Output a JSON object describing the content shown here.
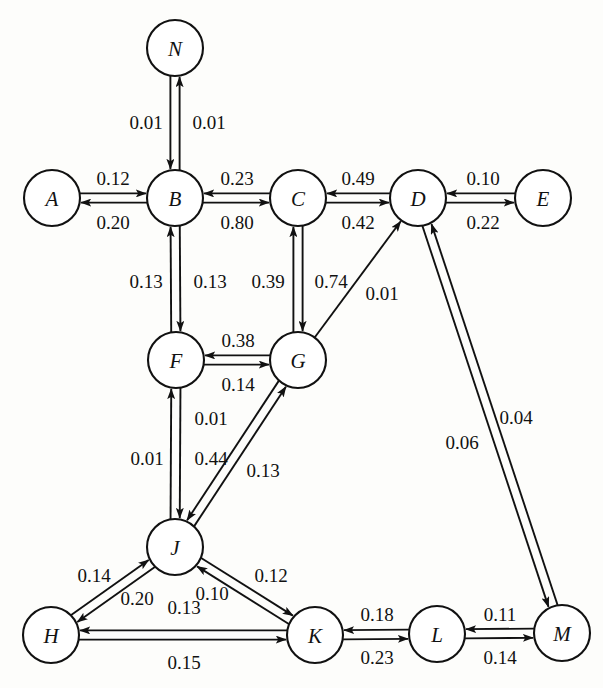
{
  "diagram": {
    "type": "directed-weighted-graph",
    "background_color": "#fdfdfb",
    "stroke_color": "#111111",
    "node_fill": "#ffffff",
    "node_radius": 28,
    "nodes": [
      {
        "id": "N",
        "label": "N",
        "x": 175,
        "y": 48
      },
      {
        "id": "A",
        "label": "A",
        "x": 52,
        "y": 198
      },
      {
        "id": "B",
        "label": "B",
        "x": 175,
        "y": 198
      },
      {
        "id": "C",
        "label": "C",
        "x": 298,
        "y": 198
      },
      {
        "id": "D",
        "label": "D",
        "x": 418,
        "y": 198
      },
      {
        "id": "E",
        "label": "E",
        "x": 543,
        "y": 198
      },
      {
        "id": "F",
        "label": "F",
        "x": 176,
        "y": 360
      },
      {
        "id": "G",
        "label": "G",
        "x": 298,
        "y": 360
      },
      {
        "id": "J",
        "label": "J",
        "x": 175,
        "y": 547
      },
      {
        "id": "H",
        "label": "H",
        "x": 51,
        "y": 635
      },
      {
        "id": "K",
        "label": "K",
        "x": 315,
        "y": 635
      },
      {
        "id": "L",
        "label": "L",
        "x": 437,
        "y": 634
      },
      {
        "id": "M",
        "label": "M",
        "x": 562,
        "y": 633
      }
    ],
    "edges": [
      {
        "from": "N",
        "to": "B",
        "weight": "0.01",
        "label_x": 146,
        "label_y": 122
      },
      {
        "from": "B",
        "to": "N",
        "weight": "0.01",
        "label_x": 209,
        "label_y": 122
      },
      {
        "from": "A",
        "to": "B",
        "weight": "0.12",
        "label_x": 113,
        "label_y": 178
      },
      {
        "from": "B",
        "to": "A",
        "weight": "0.20",
        "label_x": 113,
        "label_y": 222
      },
      {
        "from": "C",
        "to": "B",
        "weight": "0.23",
        "label_x": 237,
        "label_y": 178
      },
      {
        "from": "B",
        "to": "C",
        "weight": "0.80",
        "label_x": 237,
        "label_y": 222
      },
      {
        "from": "D",
        "to": "C",
        "weight": "0.49",
        "label_x": 358,
        "label_y": 178
      },
      {
        "from": "C",
        "to": "D",
        "weight": "0.42",
        "label_x": 358,
        "label_y": 222
      },
      {
        "from": "E",
        "to": "D",
        "weight": "0.10",
        "label_x": 483,
        "label_y": 178
      },
      {
        "from": "D",
        "to": "E",
        "weight": "0.22",
        "label_x": 483,
        "label_y": 222
      },
      {
        "from": "B",
        "to": "F",
        "weight": "0.13",
        "label_x": 146,
        "label_y": 281
      },
      {
        "from": "F",
        "to": "B",
        "weight": "0.13",
        "label_x": 210,
        "label_y": 281
      },
      {
        "from": "C",
        "to": "G",
        "weight": "0.39",
        "label_x": 268,
        "label_y": 281
      },
      {
        "from": "G",
        "to": "C",
        "weight": "0.74",
        "label_x": 331,
        "label_y": 281
      },
      {
        "from": "G",
        "to": "F",
        "weight": "0.38",
        "label_x": 238,
        "label_y": 340
      },
      {
        "from": "F",
        "to": "G",
        "weight": "0.14",
        "label_x": 238,
        "label_y": 384
      },
      {
        "from": "G",
        "to": "D",
        "weight": "0.01",
        "label_x": 382,
        "label_y": 293
      },
      {
        "from": "M",
        "to": "D",
        "weight": "0.06",
        "label_x": 462,
        "label_y": 442
      },
      {
        "from": "D",
        "to": "M",
        "weight": "0.04",
        "label_x": 516,
        "label_y": 417
      },
      {
        "from": "F",
        "to": "J",
        "weight": "0.01",
        "label_x": 147,
        "label_y": 458
      },
      {
        "from": "J",
        "to": "F",
        "weight": "0.01",
        "label_x": 211,
        "label_y": 418
      },
      {
        "from": "J",
        "to": "G",
        "weight": "0.44",
        "label_x": 211,
        "label_y": 458
      },
      {
        "from": "G",
        "to": "J",
        "weight": "0.13",
        "label_x": 263,
        "label_y": 470
      },
      {
        "from": "H",
        "to": "J",
        "weight": "0.14",
        "label_x": 94,
        "label_y": 575
      },
      {
        "from": "J",
        "to": "H",
        "weight": "0.20",
        "label_x": 137,
        "label_y": 598
      },
      {
        "from": "J",
        "to": "K",
        "weight": "0.10",
        "label_x": 212,
        "label_y": 593
      },
      {
        "from": "K",
        "to": "J",
        "weight": "0.12",
        "label_x": 271,
        "label_y": 575
      },
      {
        "from": "K",
        "to": "H",
        "weight": "0.13",
        "label_x": 184,
        "label_y": 607
      },
      {
        "from": "H",
        "to": "K",
        "weight": "0.15",
        "label_x": 184,
        "label_y": 662
      },
      {
        "from": "L",
        "to": "K",
        "weight": "0.18",
        "label_x": 377,
        "label_y": 614
      },
      {
        "from": "K",
        "to": "L",
        "weight": "0.23",
        "label_x": 377,
        "label_y": 657
      },
      {
        "from": "M",
        "to": "L",
        "weight": "0.11",
        "label_x": 500,
        "label_y": 614
      },
      {
        "from": "L",
        "to": "M",
        "weight": "0.14",
        "label_x": 500,
        "label_y": 657
      }
    ]
  }
}
